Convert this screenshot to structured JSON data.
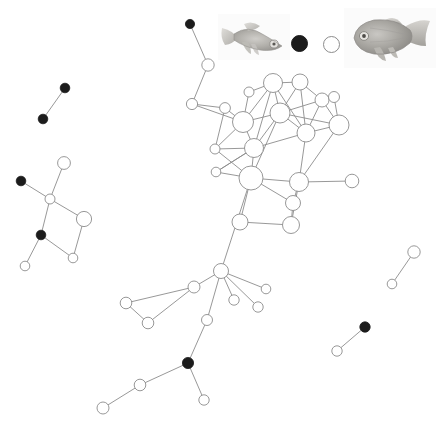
{
  "figure": {
    "type": "network-graph",
    "background_color": "#ffffff",
    "edge_color": "#8c8c8c",
    "node_open_fill": "#ffffff",
    "node_open_stroke": "#8c8c8c",
    "node_filled_fill": "#1c1c1c",
    "node_filled_stroke": "#1c1c1c",
    "width": 437,
    "height": 427
  },
  "legend": {
    "items": [
      {
        "name": "fish-small-photo",
        "kind": "image",
        "label": "",
        "x": 218,
        "y": 14,
        "w": 72,
        "h": 46
      },
      {
        "name": "legend-node-filled",
        "kind": "node-filled",
        "label": "",
        "x": 298,
        "y": 42,
        "r": 7.5
      },
      {
        "name": "legend-node-open",
        "kind": "node-open",
        "label": "",
        "x": 330,
        "y": 43,
        "r": 7.5
      },
      {
        "name": "fish-large-photo",
        "kind": "image",
        "label": "",
        "x": 344,
        "y": 8,
        "w": 92,
        "h": 60
      }
    ]
  },
  "chart_data": {
    "type": "scatter",
    "title": "",
    "xlabel": "",
    "ylabel": "",
    "nodes": [
      {
        "id": "n01",
        "x": 190,
        "y": 24,
        "r": 4.6,
        "fill": "filled"
      },
      {
        "id": "n02",
        "x": 208,
        "y": 65,
        "r": 6.2,
        "fill": "open"
      },
      {
        "id": "n03",
        "x": 192,
        "y": 104,
        "r": 5.6,
        "fill": "open"
      },
      {
        "id": "n04",
        "x": 225,
        "y": 108,
        "r": 5.4,
        "fill": "open"
      },
      {
        "id": "n05",
        "x": 243,
        "y": 122,
        "r": 10.5,
        "fill": "open"
      },
      {
        "id": "n06",
        "x": 249,
        "y": 92,
        "r": 5.0,
        "fill": "open"
      },
      {
        "id": "n07",
        "x": 273,
        "y": 83,
        "r": 9.5,
        "fill": "open"
      },
      {
        "id": "n08",
        "x": 300,
        "y": 82,
        "r": 8.0,
        "fill": "open"
      },
      {
        "id": "n09",
        "x": 322,
        "y": 100,
        "r": 7.0,
        "fill": "open"
      },
      {
        "id": "n10",
        "x": 280,
        "y": 113,
        "r": 10.0,
        "fill": "open"
      },
      {
        "id": "n11",
        "x": 339,
        "y": 125,
        "r": 10.0,
        "fill": "open"
      },
      {
        "id": "n12",
        "x": 334,
        "y": 97,
        "r": 5.5,
        "fill": "open"
      },
      {
        "id": "n13",
        "x": 306,
        "y": 133,
        "r": 9.0,
        "fill": "open"
      },
      {
        "id": "n14",
        "x": 254,
        "y": 148,
        "r": 9.5,
        "fill": "open"
      },
      {
        "id": "n15",
        "x": 215,
        "y": 149,
        "r": 5.0,
        "fill": "open"
      },
      {
        "id": "n16",
        "x": 216,
        "y": 172,
        "r": 4.8,
        "fill": "open"
      },
      {
        "id": "n17",
        "x": 251,
        "y": 178,
        "r": 12.0,
        "fill": "open"
      },
      {
        "id": "n18",
        "x": 299,
        "y": 182,
        "r": 9.5,
        "fill": "open"
      },
      {
        "id": "n19",
        "x": 352,
        "y": 181,
        "r": 6.8,
        "fill": "open"
      },
      {
        "id": "n20",
        "x": 293,
        "y": 203,
        "r": 7.5,
        "fill": "open"
      },
      {
        "id": "n21",
        "x": 240,
        "y": 222,
        "r": 8.0,
        "fill": "open"
      },
      {
        "id": "n22",
        "x": 291,
        "y": 225,
        "r": 8.5,
        "fill": "open"
      },
      {
        "id": "n23",
        "x": 221,
        "y": 271,
        "r": 7.5,
        "fill": "open"
      },
      {
        "id": "n24",
        "x": 194,
        "y": 287,
        "r": 6.0,
        "fill": "open"
      },
      {
        "id": "n25",
        "x": 126,
        "y": 303,
        "r": 5.8,
        "fill": "open"
      },
      {
        "id": "n26",
        "x": 148,
        "y": 323,
        "r": 5.8,
        "fill": "open"
      },
      {
        "id": "n27",
        "x": 266,
        "y": 289,
        "r": 4.8,
        "fill": "open"
      },
      {
        "id": "n28",
        "x": 234,
        "y": 300,
        "r": 5.2,
        "fill": "open"
      },
      {
        "id": "n29",
        "x": 258,
        "y": 307,
        "r": 5.2,
        "fill": "open"
      },
      {
        "id": "n30",
        "x": 207,
        "y": 320,
        "r": 5.5,
        "fill": "open"
      },
      {
        "id": "n31",
        "x": 188,
        "y": 363,
        "r": 5.6,
        "fill": "filled"
      },
      {
        "id": "n32",
        "x": 204,
        "y": 400,
        "r": 5.2,
        "fill": "open"
      },
      {
        "id": "n33",
        "x": 140,
        "y": 385,
        "r": 5.8,
        "fill": "open"
      },
      {
        "id": "n34",
        "x": 103,
        "y": 408,
        "r": 6.0,
        "fill": "open"
      },
      {
        "id": "n35",
        "x": 65,
        "y": 88,
        "r": 4.8,
        "fill": "filled"
      },
      {
        "id": "n36",
        "x": 43,
        "y": 119,
        "r": 4.8,
        "fill": "filled"
      },
      {
        "id": "n37",
        "x": 64,
        "y": 163,
        "r": 6.4,
        "fill": "open"
      },
      {
        "id": "n38",
        "x": 21,
        "y": 181,
        "r": 4.8,
        "fill": "filled"
      },
      {
        "id": "n39",
        "x": 50,
        "y": 199,
        "r": 5.0,
        "fill": "open"
      },
      {
        "id": "n40",
        "x": 84,
        "y": 219,
        "r": 7.6,
        "fill": "open"
      },
      {
        "id": "n41",
        "x": 41,
        "y": 235,
        "r": 4.8,
        "fill": "filled"
      },
      {
        "id": "n42",
        "x": 73,
        "y": 258,
        "r": 4.8,
        "fill": "open"
      },
      {
        "id": "n43",
        "x": 25,
        "y": 266,
        "r": 4.8,
        "fill": "open"
      },
      {
        "id": "n44",
        "x": 414,
        "y": 252,
        "r": 6.2,
        "fill": "open"
      },
      {
        "id": "n45",
        "x": 392,
        "y": 284,
        "r": 4.8,
        "fill": "open"
      },
      {
        "id": "n46",
        "x": 365,
        "y": 327,
        "r": 5.2,
        "fill": "filled"
      },
      {
        "id": "n47",
        "x": 337,
        "y": 351,
        "r": 5.2,
        "fill": "open"
      }
    ],
    "edges": [
      [
        "n01",
        "n02"
      ],
      [
        "n02",
        "n03"
      ],
      [
        "n03",
        "n05"
      ],
      [
        "n03",
        "n04"
      ],
      [
        "n04",
        "n05"
      ],
      [
        "n04",
        "n15"
      ],
      [
        "n05",
        "n06"
      ],
      [
        "n05",
        "n07"
      ],
      [
        "n05",
        "n10"
      ],
      [
        "n05",
        "n14"
      ],
      [
        "n05",
        "n15"
      ],
      [
        "n06",
        "n07"
      ],
      [
        "n07",
        "n08"
      ],
      [
        "n07",
        "n10"
      ],
      [
        "n07",
        "n13"
      ],
      [
        "n07",
        "n14"
      ],
      [
        "n08",
        "n09"
      ],
      [
        "n08",
        "n10"
      ],
      [
        "n08",
        "n13"
      ],
      [
        "n09",
        "n10"
      ],
      [
        "n09",
        "n11"
      ],
      [
        "n09",
        "n13"
      ],
      [
        "n10",
        "n13"
      ],
      [
        "n10",
        "n11"
      ],
      [
        "n10",
        "n14"
      ],
      [
        "n10",
        "n17"
      ],
      [
        "n11",
        "n12"
      ],
      [
        "n11",
        "n13"
      ],
      [
        "n11",
        "n18"
      ],
      [
        "n13",
        "n14"
      ],
      [
        "n13",
        "n18"
      ],
      [
        "n14",
        "n15"
      ],
      [
        "n14",
        "n16"
      ],
      [
        "n14",
        "n17"
      ],
      [
        "n15",
        "n17"
      ],
      [
        "n16",
        "n17"
      ],
      [
        "n16",
        "n14"
      ],
      [
        "n17",
        "n18"
      ],
      [
        "n17",
        "n20"
      ],
      [
        "n17",
        "n21"
      ],
      [
        "n17",
        "n23"
      ],
      [
        "n18",
        "n19"
      ],
      [
        "n18",
        "n20"
      ],
      [
        "n18",
        "n22"
      ],
      [
        "n20",
        "n22"
      ],
      [
        "n21",
        "n22"
      ],
      [
        "n23",
        "n24"
      ],
      [
        "n23",
        "n27"
      ],
      [
        "n23",
        "n28"
      ],
      [
        "n23",
        "n29"
      ],
      [
        "n23",
        "n30"
      ],
      [
        "n24",
        "n25"
      ],
      [
        "n24",
        "n26"
      ],
      [
        "n25",
        "n26"
      ],
      [
        "n30",
        "n31"
      ],
      [
        "n31",
        "n32"
      ],
      [
        "n31",
        "n33"
      ],
      [
        "n33",
        "n34"
      ],
      [
        "n35",
        "n36"
      ],
      [
        "n37",
        "n39"
      ],
      [
        "n38",
        "n39"
      ],
      [
        "n39",
        "n40"
      ],
      [
        "n39",
        "n41"
      ],
      [
        "n40",
        "n42"
      ],
      [
        "n41",
        "n42"
      ],
      [
        "n41",
        "n43"
      ],
      [
        "n44",
        "n45"
      ],
      [
        "n46",
        "n47"
      ]
    ],
    "legend_position": "top",
    "grid": false
  }
}
